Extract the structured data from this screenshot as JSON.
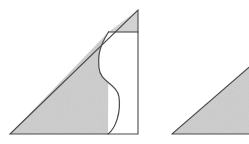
{
  "canvas": {
    "width": 249,
    "height": 144,
    "background_color": "#ffffff",
    "description": "Two geometric line-drawing figures on a white background: a large right triangle subdivided by a horizontal segment and an S-shaped curve, and a smaller plain right triangle clipped at the right image edge."
  },
  "style": {
    "fill_color": "#cdcdcd",
    "fill_color_light": "#d4d4d4",
    "stroke_color": "#4a4a4a",
    "stroke_width": 1.1,
    "white_color": "#ffffff",
    "texture": "fine speckled grain over the gray fill"
  },
  "figures": [
    {
      "id": "left-figure",
      "name": "triangle-with-s-curve",
      "label": "",
      "vertices": {
        "apex_top": [
          138,
          10
        ],
        "base_right": [
          138,
          134
        ],
        "base_left": [
          10,
          134
        ]
      },
      "regions": [
        {
          "name": "top-small-triangle",
          "fill": "shaded",
          "path": "M 138 10 L 138 32 L 108.5 32 Z",
          "note": "small shaded triangle above the horizontal divider"
        },
        {
          "name": "left-shaded-region",
          "fill": "shaded",
          "path": "M 108.5 32 C 98.5 48 98 56 99 68 C 100 82 117 84 119 97 C 121 112 116 128 108 134 L 10 134 Z",
          "note": "large shaded region bounded by hypotenuse, base, and the S-curve"
        },
        {
          "name": "right-white-region",
          "fill": "white",
          "path": "M 108.5 32 L 138 32 L 138 134 L 108 134 Z",
          "note": "unshaded region between the S-curve and the vertical right edge"
        }
      ],
      "edges": [
        {
          "name": "hypotenuse",
          "from": [
            10,
            134
          ],
          "to": [
            138,
            10
          ],
          "kind": "straight"
        },
        {
          "name": "right-vertical-edge",
          "from": [
            138,
            10
          ],
          "to": [
            138,
            134
          ],
          "kind": "straight"
        },
        {
          "name": "base",
          "from": [
            10,
            134
          ],
          "to": [
            138,
            134
          ],
          "kind": "straight"
        },
        {
          "name": "horizontal-divider",
          "from": [
            108.5,
            32
          ],
          "to": [
            138,
            32
          ],
          "kind": "straight"
        },
        {
          "name": "s-curve",
          "from": [
            108.5,
            32
          ],
          "to": [
            108,
            134
          ],
          "kind": "curve"
        }
      ]
    },
    {
      "id": "right-figure",
      "name": "plain-right-triangle",
      "label": "",
      "clipped": true,
      "vertices": {
        "base_left": [
          172,
          134
        ],
        "base_right": [
          262,
          134
        ],
        "apex_right": [
          262,
          56
        ]
      },
      "regions": [
        {
          "name": "triangle-body",
          "fill": "shaded",
          "path": "M 172 134 L 262 134 L 262 56 Z",
          "note": "fully shaded right triangle, right portion clipped by the image edge"
        }
      ],
      "edges": [
        {
          "name": "hypotenuse",
          "from": [
            172,
            134
          ],
          "to": [
            262,
            56
          ],
          "kind": "straight"
        },
        {
          "name": "base",
          "from": [
            172,
            134
          ],
          "to": [
            262,
            134
          ],
          "kind": "straight"
        }
      ]
    }
  ]
}
